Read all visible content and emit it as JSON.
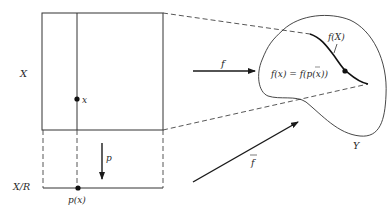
{
  "diagram": {
    "labels": {
      "space_X": "X",
      "quotient": "X/R",
      "point_x": "x",
      "point_px": "p(x)",
      "map_p": "p",
      "map_f": "f",
      "map_fbar": "f",
      "image": "f(X)",
      "equation": "f(x) = f(p(x))",
      "space_Y": "Y"
    },
    "colors": {
      "stroke": "#1a1a1a",
      "text": "#2a2a2a",
      "background": "#ffffff"
    }
  }
}
